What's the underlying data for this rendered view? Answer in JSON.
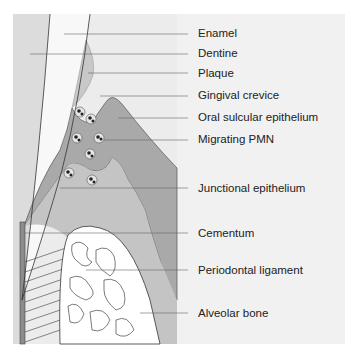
{
  "figure": {
    "type": "anatomical cross-section"
  },
  "labels": [
    {
      "text": "Enamel",
      "y": 27
    },
    {
      "text": "Dentine",
      "y": 47
    },
    {
      "text": "Plaque",
      "y": 67
    },
    {
      "text": "Gingival crevice",
      "y": 89
    },
    {
      "text": "Oral sulcular epithelium",
      "y": 111
    },
    {
      "text": "Migrating PMN",
      "y": 133
    },
    {
      "text": "Junctional epithelium",
      "y": 182
    },
    {
      "text": "Cementum",
      "y": 229
    },
    {
      "text": "Periodontal ligament",
      "y": 267
    },
    {
      "text": "Alveolar bone",
      "y": 310
    }
  ],
  "colors": {
    "panel": "#f1f1f1",
    "tooth": "#f7f7f7",
    "enamel_left": "#dcdcdc",
    "plaque": "#c8c8c8",
    "gingiva_dark": "#a9a9a9",
    "gingiva_light": "#c4c4c4",
    "bone": "#ffffff",
    "cementum": "#8c8c8c",
    "leader_line": "#666666"
  }
}
